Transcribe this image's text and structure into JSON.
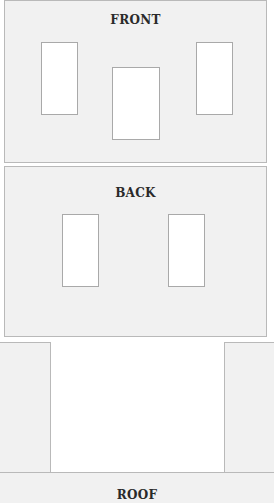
{
  "panels": {
    "front": {
      "label": "FRONT"
    },
    "back": {
      "label": "BACK"
    },
    "roof": {
      "label": "ROOF"
    }
  },
  "colors": {
    "panel_fill": "#f1f1f1",
    "panel_border": "#b9b9b9",
    "window_fill": "#ffffff",
    "text": "#2a2a2a"
  }
}
